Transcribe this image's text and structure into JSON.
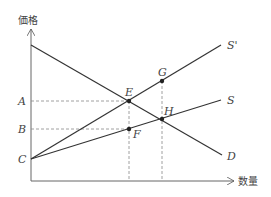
{
  "diagram": {
    "axes": {
      "y_label": "価格",
      "x_label": "数量"
    },
    "curves": {
      "demand": "D",
      "supply": "S",
      "supply_shifted": "S'"
    },
    "points": {
      "E": "E",
      "F": "F",
      "G": "G",
      "H": "H"
    },
    "price_levels": {
      "A": "A",
      "B": "B",
      "C": "C"
    },
    "colors": {
      "line": "#333333",
      "dashed": "#888888",
      "text": "#444444"
    }
  }
}
